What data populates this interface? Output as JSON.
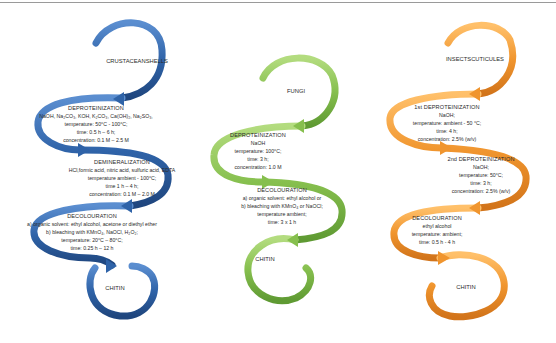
{
  "colors": {
    "crustacean": "#2f63a8",
    "fungi": "#86bf4e",
    "insects": "#f0952e",
    "topline": "#9a9a9a"
  },
  "crustacean": {
    "source": [
      "CRUSTACEAN",
      "SHELLS"
    ],
    "steps": [
      {
        "title": "DEPROTEINIZATION",
        "lines": [
          "NaOH, Na₂CO₃, KOH, K₂CO₃, Ca(OH)₂, Na₂SO₃,",
          "temperature: 50°C - 100°C;",
          "time: 0.5 h – 6 h;",
          "concentration: 0.1 M – 2.5 M"
        ]
      },
      {
        "title": "DEMINERALIZATION",
        "lines": [
          "HCl,formic acid, nitric acid, sulfuric acid, EDTA",
          "temperature ambient - 100°C;",
          "time 1 h – 4 h;",
          "concentration: 0.1 M – 2.0 M"
        ]
      },
      {
        "title": "DECOLOURATION",
        "lines": [
          "a) organic solvent: ethyl alcohol, acetone or diethyl ether",
          "b) bleaching with KMnO₄, NaOCl, H₂O₂;",
          "temperature: 20°C – 80°C;",
          "time: 0.25 h – 12 h"
        ]
      }
    ],
    "product": "CHITIN"
  },
  "fungi": {
    "source": [
      "FUNGI"
    ],
    "steps": [
      {
        "title": "DEPROTEINIZATION",
        "lines": [
          "NaOH",
          "temperature: 100°C;",
          "time: 3 h;",
          "concentration: 1.0 M"
        ]
      },
      {
        "title": "DECOLOURATION",
        "lines": [
          "a) organic solvent: ethyl alcohol or",
          "b) bleaching with KMnO₄ or NaOCl;",
          "temperature ambient;",
          "time: 3 x 1 h"
        ]
      }
    ],
    "product": "CHITIN"
  },
  "insects": {
    "source": [
      "INSECTS",
      "CUTICULES"
    ],
    "steps": [
      {
        "title": "1st DEPROTEINIZATION",
        "lines": [
          "NaOH;",
          "temperature: ambient - 50 °C;",
          "time: 4 h;",
          "concentration: 2.5% (w/v)"
        ]
      },
      {
        "title": "2nd DEPROTEINIZATION",
        "lines": [
          "NaOH;",
          "temperature: 50°C;",
          "time: 3 h;",
          "concentration: 2.5% (w/v)"
        ]
      },
      {
        "title": "DECOLOURATION",
        "lines": [
          "ethyl alcohol",
          "temperature: ambient;",
          "time: 0.5 h - 4 h"
        ]
      }
    ],
    "product": "CHITIN"
  }
}
